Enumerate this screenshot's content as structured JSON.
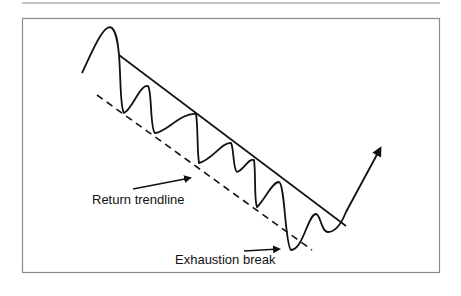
{
  "diagram": {
    "title": "",
    "labels": {
      "return_trendline": "Return trendline",
      "exhaustion_break": "Exhaustion break"
    },
    "elements": {
      "upper_trendline": "solid descending trendline",
      "lower_trendline": "dashed descending return trendline",
      "price_path": "oscillating price path ending in upward breakout arrow"
    },
    "colors": {
      "stroke": "#111111",
      "frame": "#8a8a8a"
    }
  }
}
